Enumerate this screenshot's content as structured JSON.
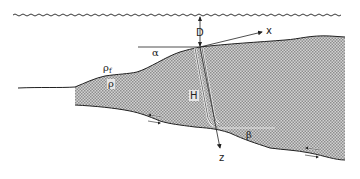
{
  "diagram": {
    "type": "wedge-cross-section",
    "labels": {
      "depth": "D",
      "x_axis": "x",
      "z_axis": "z",
      "surface_slope": "α",
      "base_dip": "β",
      "fluid_density": "ρf",
      "fluid_density_base": "ρ",
      "fluid_density_sub": "f",
      "wedge_density": "ρ",
      "thickness": "H"
    },
    "colors": {
      "line": "#222222",
      "fill_light": "#ffffff",
      "fill_dark": "#9a9a9a",
      "background": "#ffffff"
    },
    "elements": [
      "sea-surface",
      "depth-arrow",
      "wedge-body",
      "x-axis-arrow",
      "z-axis-arrow",
      "thickness-column",
      "alpha-reference-line",
      "beta-reference-line",
      "shear-arrows-left",
      "shear-arrows-right"
    ]
  }
}
